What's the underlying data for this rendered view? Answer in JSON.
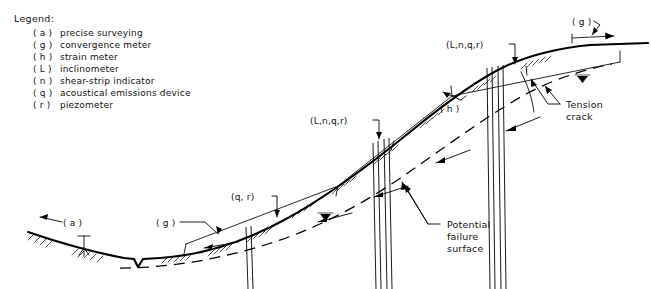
{
  "figure": {
    "background_color": "#ffffff",
    "ink_color": "#000000"
  },
  "legend": {
    "heading": "Legend:",
    "items": [
      {
        "key": "( a )",
        "label": "precise surveying"
      },
      {
        "key": "( g )",
        "label": "convergence meter"
      },
      {
        "key": "( h )",
        "label": "strain meter"
      },
      {
        "key": "( L )",
        "label": "inclinometer"
      },
      {
        "key": "( n )",
        "label": "shear-strip indicator"
      },
      {
        "key": "( q )",
        "label": "acoustical emissions device"
      },
      {
        "key": "( r )",
        "label": "piezometer"
      }
    ]
  },
  "callouts": {
    "precise_surveying": "( a )",
    "convergence_meter_lower": "( g )",
    "convergence_meter_crest": "( g )",
    "piezometer_cluster": "(q, r)",
    "borehole_mid": "(L,n,q,r)",
    "borehole_upper": "(L,n,q,r)",
    "strain_meter": "( h )"
  },
  "annotations": {
    "tension_crack": {
      "line1": "Tension",
      "line2": "crack"
    },
    "potential_failure_surface": {
      "line1": "Potential",
      "line2": "failure",
      "line3": "surface"
    }
  },
  "symbols": {
    "survey_tripod": "survey-tripod-icon",
    "water_table_left": "water-table-icon",
    "water_table_right": "water-table-icon",
    "ground_hatching": "ground-hatch-icon",
    "convergence_arrow": "double-arrow-icon"
  }
}
